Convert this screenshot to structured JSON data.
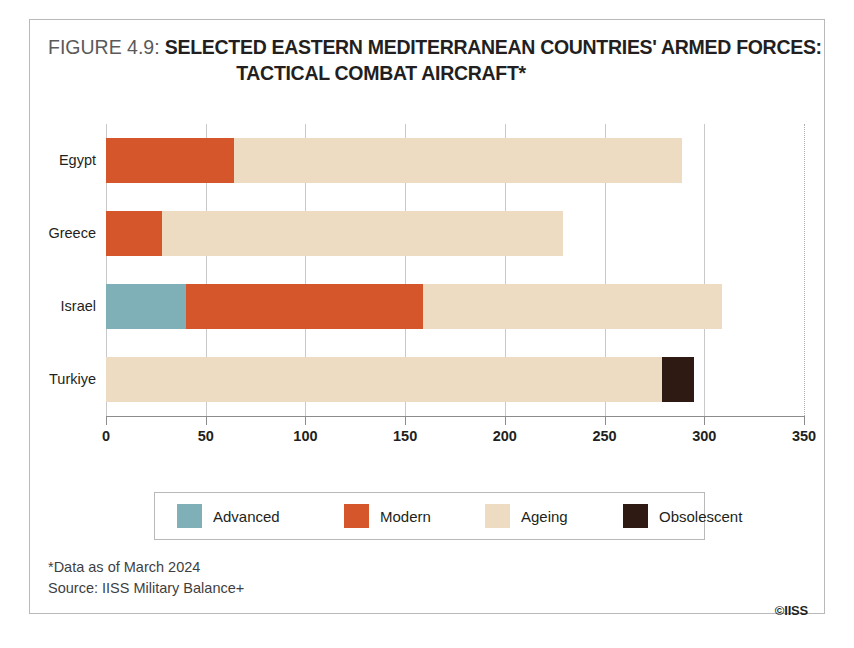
{
  "figure": {
    "label": "FIGURE 4.9:",
    "title_line_1": "SELECTED EASTERN MEDITERRANEAN COUNTRIES' ARMED FORCES:",
    "title_line_2": "TACTICAL COMBAT AIRCRAFT*"
  },
  "footer": {
    "note": "*Data as of March 2024",
    "source": "Source: IISS Military Balance+",
    "copyright": "©IISS"
  },
  "colors": {
    "advanced": "#7FB0B8",
    "modern": "#D6562B",
    "ageing": "#EDDCC2",
    "obsolescent": "#2E1A12",
    "axis": "#8C8C8C",
    "gridline": "#C9C9C9",
    "border": "#B9B9B9",
    "text": "#231F20"
  },
  "chart_data": {
    "type": "bar",
    "orientation": "horizontal",
    "stacked": true,
    "title": "FIGURE 4.9: SELECTED EASTERN MEDITERRANEAN COUNTRIES' ARMED FORCES: TACTICAL COMBAT AIRCRAFT*",
    "xlabel": "",
    "ylabel": "",
    "xlim": [
      0,
      350
    ],
    "xticks": [
      0,
      50,
      100,
      150,
      200,
      250,
      300,
      350
    ],
    "xtick_labels": [
      "0",
      "50",
      "100",
      "150",
      "200",
      "250",
      "300",
      "350"
    ],
    "grid": true,
    "legend_position": "bottom",
    "categories": [
      "Egypt",
      "Greece",
      "Israel",
      "Turkiye"
    ],
    "series": [
      {
        "name": "Advanced",
        "color": "#7FB0B8",
        "values": [
          0,
          0,
          40,
          0
        ]
      },
      {
        "name": "Modern",
        "color": "#D6562B",
        "values": [
          64,
          28,
          119,
          0
        ]
      },
      {
        "name": "Ageing",
        "color": "#EDDCC2",
        "values": [
          225,
          201,
          150,
          279
        ]
      },
      {
        "name": "Obsolescent",
        "color": "#2E1A12",
        "values": [
          0,
          0,
          0,
          16
        ]
      }
    ],
    "totals": [
      289,
      229,
      309,
      295
    ],
    "annotations": [
      "*Data as of March 2024",
      "Source: IISS Military Balance+"
    ]
  }
}
